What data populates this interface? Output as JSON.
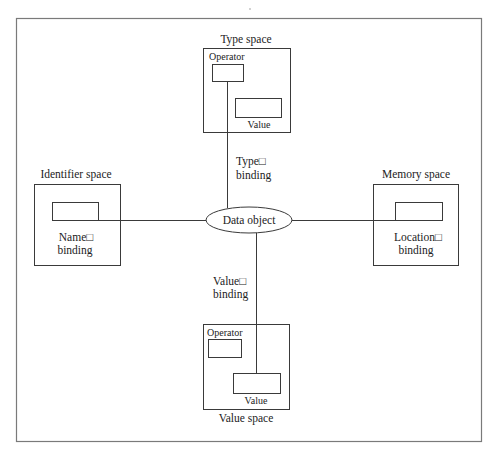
{
  "diagram": {
    "center": {
      "label": "Data object"
    },
    "spaces": {
      "type": {
        "title": "Type space",
        "operator_label": "Operator",
        "value_label": "Value"
      },
      "identifier": {
        "title": "Identifier space",
        "binding_line1": "Name□",
        "binding_line2": "binding"
      },
      "memory": {
        "title": "Memory space",
        "binding_line1": "Location□",
        "binding_line2": "binding"
      },
      "value": {
        "title": "Value space",
        "operator_label": "Operator",
        "value_label": "Value"
      }
    },
    "bindings": {
      "type": {
        "line1": "Type□",
        "line2": "binding"
      },
      "value": {
        "line1": "Value□",
        "line2": "binding"
      }
    }
  }
}
